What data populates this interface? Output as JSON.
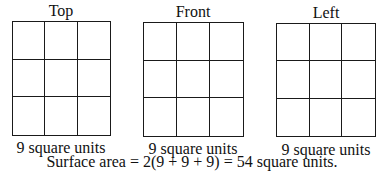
{
  "views": [
    {
      "title": "Top",
      "caption": "9 square units",
      "rows": 3,
      "cols": 3
    },
    {
      "title": "Front",
      "caption": "9 square units",
      "rows": 3,
      "cols": 3
    },
    {
      "title": "Left",
      "caption": "9 square units",
      "rows": 3,
      "cols": 3
    }
  ],
  "summary": "Surface area = 2(9 + 9 + 9) = 54 square units."
}
